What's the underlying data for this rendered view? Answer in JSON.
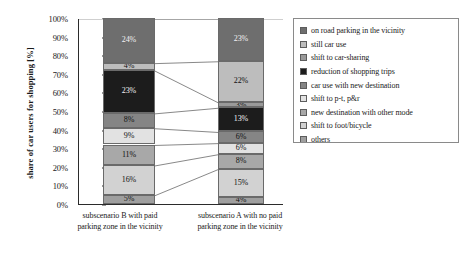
{
  "chart_data": {
    "type": "bar",
    "title": "",
    "xlabel": "",
    "ylabel": "share of car users for shopping [%]",
    "ylim": [
      0,
      100
    ],
    "stacked": true,
    "stack_mode": "percent",
    "grid": false,
    "legend_position": "right",
    "y_ticks": [
      "0%",
      "10%",
      "20%",
      "30%",
      "40%",
      "50%",
      "60%",
      "70%",
      "80%",
      "90%",
      "100%"
    ],
    "categories": [
      "subscenario B with paid parking zone in the vicinity",
      "subscenario A with no paid parking zone in the vicinity"
    ],
    "category_lines": [
      [
        "subscenario B with paid",
        "parking zone in the vicinity"
      ],
      [
        "subscenario A with no paid",
        "parking zone in the vicinity"
      ]
    ],
    "series": [
      {
        "name": "on road parking in the vicinity",
        "color": "#6e6e6e",
        "values": [
          24,
          23
        ],
        "labels": [
          "24%",
          "23%"
        ]
      },
      {
        "name": "still car use",
        "color": "#bdbdbd",
        "values": [
          4,
          22
        ],
        "labels": [
          "4%",
          "22%"
        ]
      },
      {
        "name": "shift to car-sharing",
        "color": "#9a9a9a",
        "values": [
          0,
          3
        ],
        "labels": [
          "",
          "3%"
        ]
      },
      {
        "name": "reduction of shopping trips",
        "color": "#1c1c1c",
        "values": [
          23,
          13
        ],
        "labels": [
          "23%",
          "13%"
        ]
      },
      {
        "name": "car use with new destination",
        "color": "#858585",
        "values": [
          8,
          6
        ],
        "labels": [
          "8%",
          "6%"
        ]
      },
      {
        "name": "shift to p-t, p&r",
        "color": "#e2e2e2",
        "values": [
          9,
          6
        ],
        "labels": [
          "9%",
          "6%"
        ]
      },
      {
        "name": "new destination with other mode",
        "color": "#a8a8a8",
        "values": [
          11,
          8
        ],
        "labels": [
          "11%",
          "8%"
        ]
      },
      {
        "name": "shift to foot/bicycle",
        "color": "#d2d2d2",
        "values": [
          16,
          15
        ],
        "labels": [
          "16%",
          "15%"
        ]
      },
      {
        "name": "others",
        "color": "#9f9f9f",
        "values": [
          5,
          4
        ],
        "labels": [
          "5%",
          "4%"
        ]
      }
    ],
    "totals": [
      100,
      100
    ]
  },
  "legend": {
    "items": [
      {
        "label": "on road parking in the vicinity",
        "color": "#6e6e6e"
      },
      {
        "label": "still car use",
        "color": "#bdbdbd"
      },
      {
        "label": "shift to car-sharing",
        "color": "#9a9a9a"
      },
      {
        "label": "reduction of shopping trips",
        "color": "#1c1c1c"
      },
      {
        "label": "car use with new destination",
        "color": "#858585"
      },
      {
        "label": "shift to p-t, p&r",
        "color": "#e2e2e2"
      },
      {
        "label": "new destination with other mode",
        "color": "#a8a8a8"
      },
      {
        "label": "shift to foot/bicycle",
        "color": "#d2d2d2"
      },
      {
        "label": "others",
        "color": "#9f9f9f"
      }
    ]
  }
}
